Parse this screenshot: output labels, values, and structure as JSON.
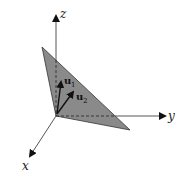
{
  "diagram": {
    "axes": {
      "x_label": "x",
      "y_label": "y",
      "z_label": "z"
    },
    "vectors": [
      {
        "name": "u",
        "subscript": "1"
      },
      {
        "name": "u",
        "subscript": "2"
      }
    ],
    "plane": {
      "fill": "#8a8a8a",
      "edge": "#333333"
    }
  }
}
